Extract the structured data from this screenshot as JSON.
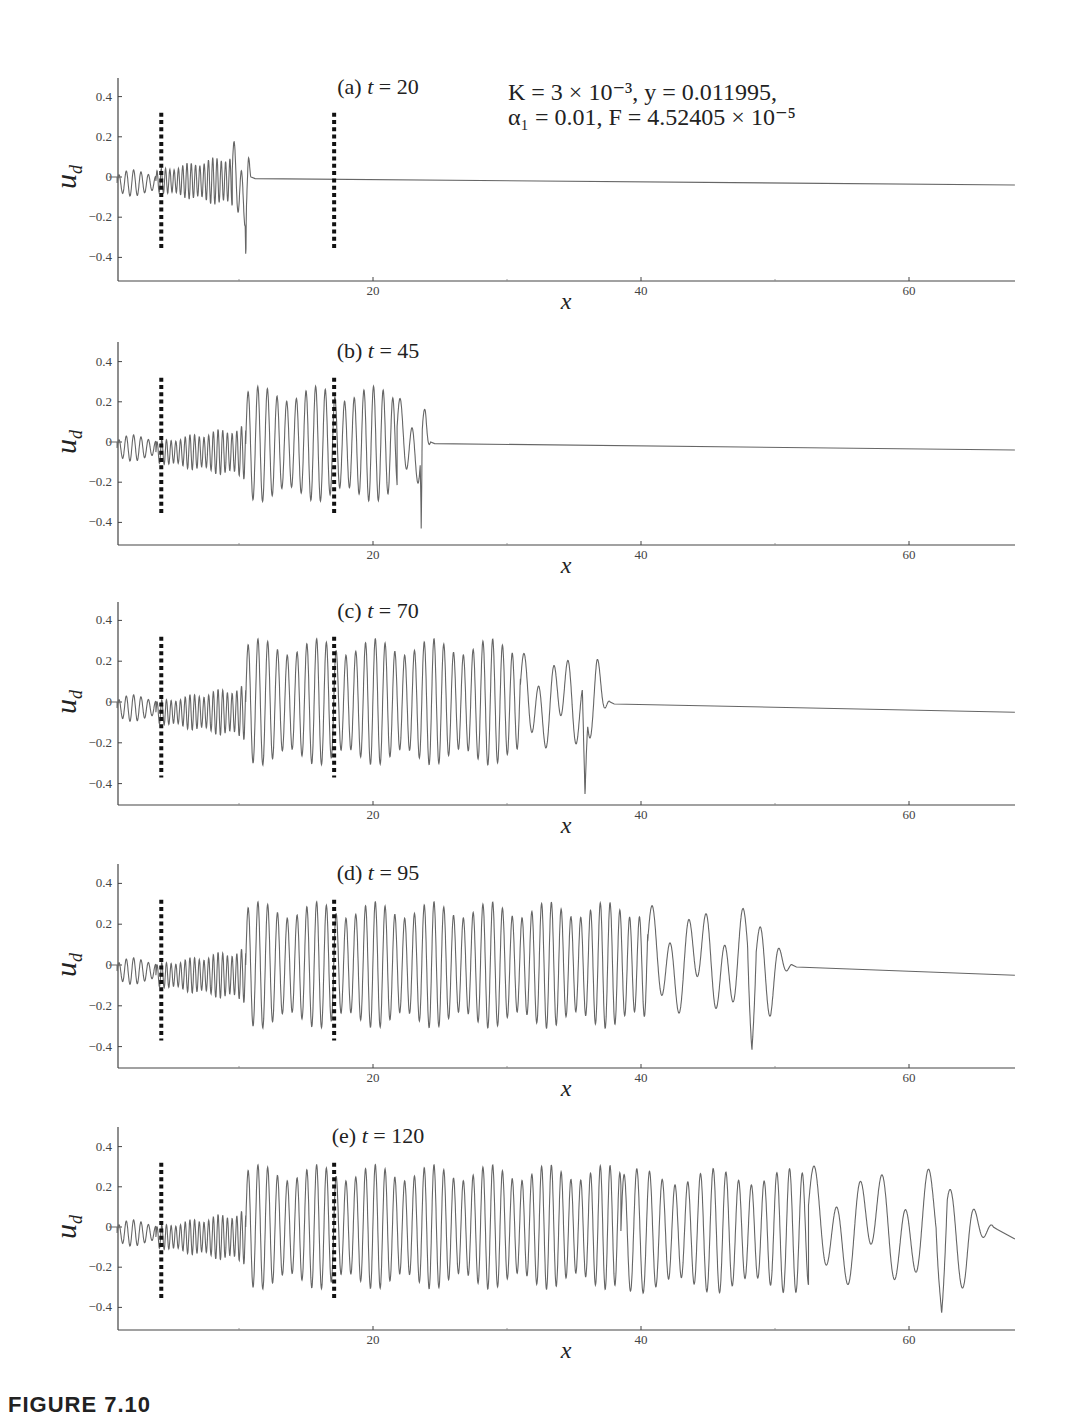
{
  "figure": {
    "parameters_line1": "K = 3 × 10⁻³, y = 0.011995,",
    "parameters_line2": "α₁ = 0.01, F = 4.52405 × 10⁻⁵",
    "caption_fragment": "FIGURE 7.10"
  },
  "chart_data": [
    {
      "type": "line",
      "panel": "(a)",
      "title": "(a)  t = 20",
      "xlabel": "x",
      "ylabel": "u_d",
      "xticks": [
        20,
        40,
        60
      ],
      "yticks": [
        0.4,
        0.2,
        0,
        -0.2,
        -0.4
      ],
      "xlim": [
        0,
        68
      ],
      "ylim": [
        -0.5,
        0.5
      ],
      "dotted_markers_x": [
        4.2,
        17.1
      ],
      "wavefront_x": 10.8,
      "max_amplitude_pos": 0.18,
      "min_amplitude_neg": -0.42,
      "baseline_far_right": -0.04,
      "segments": [
        {
          "x0": 0.9,
          "x1": 3.8,
          "wl": 0.55,
          "amp": 0.06,
          "off": -0.03
        },
        {
          "x0": 3.8,
          "x1": 9.5,
          "wl": 0.32,
          "amp": 0.12,
          "off": -0.02
        },
        {
          "x0": 9.5,
          "x1": 10.9,
          "wl": 0.55,
          "amp": 0.2,
          "off": -0.04,
          "spike": -0.42
        }
      ]
    },
    {
      "type": "line",
      "panel": "(b)",
      "title": "(b)  t = 45",
      "xlabel": "x",
      "ylabel": "u_d",
      "xticks": [
        20,
        40,
        60
      ],
      "yticks": [
        0.4,
        0.2,
        0,
        -0.2,
        -0.4
      ],
      "xlim": [
        0,
        68
      ],
      "ylim": [
        -0.5,
        0.5
      ],
      "dotted_markers_x": [
        4.2,
        17.1
      ],
      "wavefront_x": 24.5,
      "max_amplitude_pos": 0.27,
      "min_amplitude_neg": -0.43,
      "baseline_far_right": -0.04,
      "segments": [
        {
          "x0": 0.9,
          "x1": 3.8,
          "wl": 0.55,
          "amp": 0.06,
          "off": -0.03
        },
        {
          "x0": 3.8,
          "x1": 10.5,
          "wl": 0.35,
          "amp": 0.12,
          "off": -0.05
        },
        {
          "x0": 10.5,
          "x1": 21.8,
          "wl": 0.72,
          "amp": 0.25,
          "off": -0.01
        },
        {
          "x0": 21.8,
          "x1": 24.3,
          "wl": 0.9,
          "amp": 0.2,
          "off": 0.0,
          "spike": -0.43
        }
      ]
    },
    {
      "type": "line",
      "panel": "(c)",
      "title": "(c)  t = 70",
      "xlabel": "x",
      "ylabel": "u_d",
      "xticks": [
        20,
        40,
        60
      ],
      "yticks": [
        0.4,
        0.2,
        0,
        -0.2,
        -0.4
      ],
      "xlim": [
        0,
        68
      ],
      "ylim": [
        -0.5,
        0.5
      ],
      "dotted_markers_x": [
        4.2,
        17.1
      ],
      "wavefront_x": 37.9,
      "max_amplitude_pos": 0.28,
      "min_amplitude_neg": -0.46,
      "baseline_far_right": -0.05,
      "segments": [
        {
          "x0": 0.9,
          "x1": 3.8,
          "wl": 0.55,
          "amp": 0.06,
          "off": -0.03
        },
        {
          "x0": 3.8,
          "x1": 10.5,
          "wl": 0.35,
          "amp": 0.12,
          "off": -0.05
        },
        {
          "x0": 10.5,
          "x1": 31.0,
          "wl": 0.73,
          "amp": 0.27,
          "off": 0.0
        },
        {
          "x0": 31.0,
          "x1": 37.7,
          "wl": 1.1,
          "amp": 0.22,
          "off": 0.0,
          "spike": -0.46
        }
      ]
    },
    {
      "type": "line",
      "panel": "(d)",
      "title": "(d)  t = 95",
      "xlabel": "x",
      "ylabel": "u_d",
      "xticks": [
        20,
        40,
        60
      ],
      "yticks": [
        0.4,
        0.2,
        0,
        -0.2,
        -0.4
      ],
      "xlim": [
        0,
        68
      ],
      "ylim": [
        -0.5,
        0.5
      ],
      "dotted_markers_x": [
        4.2,
        17.1
      ],
      "wavefront_x": 51.5,
      "max_amplitude_pos": 0.35,
      "min_amplitude_neg": -0.42,
      "baseline_far_right": -0.05,
      "segments": [
        {
          "x0": 0.9,
          "x1": 3.8,
          "wl": 0.55,
          "amp": 0.06,
          "off": -0.03
        },
        {
          "x0": 3.8,
          "x1": 10.5,
          "wl": 0.35,
          "amp": 0.12,
          "off": -0.05
        },
        {
          "x0": 10.5,
          "x1": 40.5,
          "wl": 0.73,
          "amp": 0.27,
          "off": 0.0
        },
        {
          "x0": 40.5,
          "x1": 51.3,
          "wl": 1.35,
          "amp": 0.25,
          "off": 0.02,
          "spike": -0.42
        }
      ]
    },
    {
      "type": "line",
      "panel": "(e)",
      "title": "(e)  t = 120",
      "xlabel": "x",
      "ylabel": "u_d",
      "xticks": [
        20,
        40,
        60
      ],
      "yticks": [
        0.4,
        0.2,
        0,
        -0.2,
        -0.4
      ],
      "xlim": [
        0,
        68
      ],
      "ylim": [
        -0.5,
        0.5
      ],
      "dotted_markers_x": [
        4.2,
        17.1
      ],
      "wavefront_x": 66.5,
      "max_amplitude_pos": 0.41,
      "min_amplitude_neg": -0.43,
      "baseline_far_right": -0.06,
      "segments": [
        {
          "x0": 0.9,
          "x1": 3.8,
          "wl": 0.55,
          "amp": 0.06,
          "off": -0.03
        },
        {
          "x0": 3.8,
          "x1": 10.5,
          "wl": 0.35,
          "amp": 0.12,
          "off": -0.05
        },
        {
          "x0": 10.5,
          "x1": 38.5,
          "wl": 0.73,
          "amp": 0.27,
          "off": 0.0
        },
        {
          "x0": 38.5,
          "x1": 52.5,
          "wl": 0.95,
          "amp": 0.27,
          "off": -0.02
        },
        {
          "x0": 52.5,
          "x1": 66.3,
          "wl": 1.7,
          "amp": 0.28,
          "off": 0.0,
          "spike": -0.43
        }
      ]
    }
  ],
  "panels_layout": [
    {
      "top": 78,
      "zero_y": 177,
      "px_per_unit_y": 201,
      "bottom": 281
    },
    {
      "top": 342,
      "zero_y": 442,
      "px_per_unit_y": 201,
      "bottom": 545
    },
    {
      "top": 602,
      "zero_y": 702,
      "px_per_unit_y": 204,
      "bottom": 805
    },
    {
      "top": 864,
      "zero_y": 965,
      "px_per_unit_y": 204,
      "bottom": 1068
    },
    {
      "top": 1127,
      "zero_y": 1227,
      "px_per_unit_y": 201,
      "bottom": 1330
    }
  ],
  "axes": {
    "x0_px": 105,
    "px_per_unit_x": 13.4,
    "left_px": 118,
    "right_px": 1015
  }
}
